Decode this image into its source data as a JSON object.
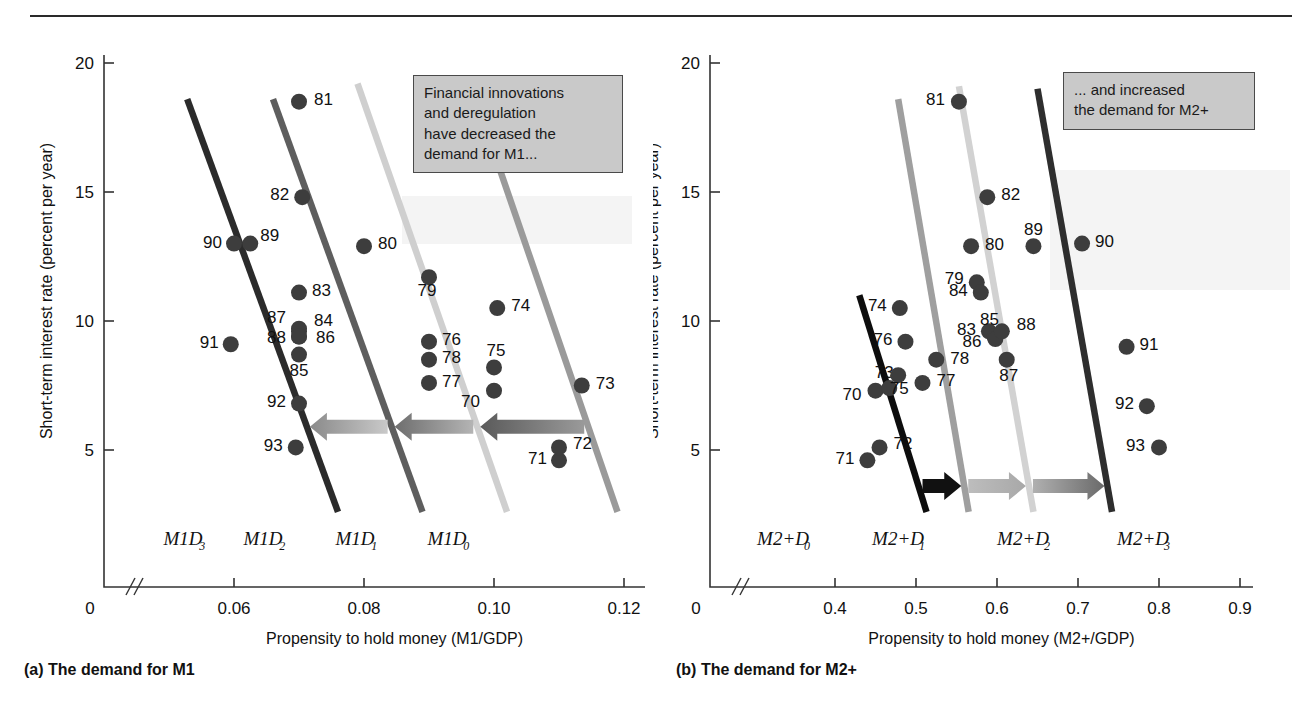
{
  "figure": {
    "panels": [
      {
        "id": "a",
        "caption": "(a) The demand for M1",
        "ylabel": "Short-term interest rate (percent per year)",
        "xlabel": "Propensity to hold money (M1/GDP)",
        "note_lines": [
          "Financial innovations",
          "and deregulation",
          "have decreased the",
          "demand for M1..."
        ],
        "x_ticks": [
          "0",
          "0.06",
          "0.08",
          "0.10",
          "0.12"
        ],
        "y_ticks": [
          "5",
          "10",
          "15",
          "20"
        ],
        "curve_labels": [
          "M1D",
          "M1D",
          "M1D",
          "M1D"
        ],
        "curve_subs": [
          "3",
          "2",
          "1",
          "0"
        ]
      },
      {
        "id": "b",
        "caption": "(b) The demand for M2+",
        "ylabel": "Short-term interest rate (percent per year)",
        "xlabel": "Propensity to hold money (M2+/GDP)",
        "note_lines": [
          "... and increased",
          "the demand for M2+"
        ],
        "x_ticks": [
          "0",
          "0.4",
          "0.5",
          "0.6",
          "0.7",
          "0.8",
          "0.9"
        ],
        "y_ticks": [
          "5",
          "10",
          "15",
          "20"
        ],
        "curve_labels": [
          "M2+D",
          "M2+D",
          "M2+D",
          "M2+D"
        ],
        "curve_subs": [
          "0",
          "1",
          "2",
          "3"
        ]
      }
    ]
  },
  "chart_data": [
    {
      "type": "scatter",
      "panel": "a",
      "title": "(a) The demand for M1",
      "xlabel": "Propensity to hold money (M1/GDP)",
      "ylabel": "Short-term interest rate (percent per year)",
      "xlim": [
        0.05,
        0.125
      ],
      "ylim": [
        0,
        20
      ],
      "xticks": [
        0.06,
        0.08,
        0.1,
        0.12
      ],
      "yticks": [
        5,
        10,
        15,
        20
      ],
      "grid": false,
      "axis_break_x": true,
      "points": [
        {
          "label": "70",
          "x": 0.1,
          "y": 7.3
        },
        {
          "label": "71",
          "x": 0.11,
          "y": 4.6
        },
        {
          "label": "72",
          "x": 0.11,
          "y": 5.1
        },
        {
          "label": "73",
          "x": 0.1135,
          "y": 7.5
        },
        {
          "label": "74",
          "x": 0.1005,
          "y": 10.5
        },
        {
          "label": "75",
          "x": 0.1,
          "y": 8.2
        },
        {
          "label": "76",
          "x": 0.09,
          "y": 9.2
        },
        {
          "label": "77",
          "x": 0.09,
          "y": 7.6
        },
        {
          "label": "78",
          "x": 0.09,
          "y": 8.5
        },
        {
          "label": "79",
          "x": 0.09,
          "y": 11.7
        },
        {
          "label": "80",
          "x": 0.08,
          "y": 12.9
        },
        {
          "label": "81",
          "x": 0.07,
          "y": 18.5
        },
        {
          "label": "82",
          "x": 0.0705,
          "y": 14.8
        },
        {
          "label": "83",
          "x": 0.07,
          "y": 11.1
        },
        {
          "label": "84",
          "x": 0.07,
          "y": 9.6
        },
        {
          "label": "85",
          "x": 0.07,
          "y": 8.7
        },
        {
          "label": "86",
          "x": 0.07,
          "y": 9.4
        },
        {
          "label": "87",
          "x": 0.07,
          "y": 9.7
        },
        {
          "label": "88",
          "x": 0.07,
          "y": 9.4
        },
        {
          "label": "89",
          "x": 0.0625,
          "y": 13.0
        },
        {
          "label": "90",
          "x": 0.06,
          "y": 13.0
        },
        {
          "label": "91",
          "x": 0.0595,
          "y": 9.1
        },
        {
          "label": "92",
          "x": 0.07,
          "y": 6.8
        },
        {
          "label": "93",
          "x": 0.0695,
          "y": 5.1
        }
      ],
      "curves": [
        {
          "name": "M1D3",
          "color": "#2b2b2b",
          "x0": 0.0528,
          "y0": 18.6,
          "x1": 0.076,
          "y1": 2.6
        },
        {
          "name": "M1D2",
          "color": "#5e5e5e",
          "x0": 0.066,
          "y0": 18.6,
          "x1": 0.089,
          "y1": 2.6
        },
        {
          "name": "M1D1",
          "color": "#cfcfcf",
          "x0": 0.079,
          "y0": 19.2,
          "x1": 0.102,
          "y1": 2.6
        },
        {
          "name": "M1D0",
          "color": "#9a9a9a",
          "x0": 0.098,
          "y0": 18.0,
          "x1": 0.119,
          "y1": 2.6
        }
      ],
      "arrows": {
        "direction": "left",
        "count": 3,
        "y": 5.9
      }
    },
    {
      "type": "scatter",
      "panel": "b",
      "title": "(b) The demand for M2+",
      "xlabel": "Propensity to hold money (M2+/GDP)",
      "ylabel": "Short-term interest rate (percent per year)",
      "xlim": [
        0.35,
        0.95
      ],
      "ylim": [
        0,
        20
      ],
      "xticks": [
        0.4,
        0.5,
        0.6,
        0.7,
        0.8,
        0.9
      ],
      "yticks": [
        5,
        10,
        15,
        20
      ],
      "grid": false,
      "axis_break_x": true,
      "points": [
        {
          "label": "70",
          "x": 0.45,
          "y": 7.3
        },
        {
          "label": "71",
          "x": 0.44,
          "y": 4.6
        },
        {
          "label": "72",
          "x": 0.455,
          "y": 5.1
        },
        {
          "label": "73",
          "x": 0.467,
          "y": 7.4
        },
        {
          "label": "74",
          "x": 0.48,
          "y": 10.5
        },
        {
          "label": "75",
          "x": 0.478,
          "y": 7.9
        },
        {
          "label": "76",
          "x": 0.487,
          "y": 9.2
        },
        {
          "label": "77",
          "x": 0.508,
          "y": 7.6
        },
        {
          "label": "78",
          "x": 0.525,
          "y": 8.5
        },
        {
          "label": "79",
          "x": 0.575,
          "y": 11.5
        },
        {
          "label": "80",
          "x": 0.568,
          "y": 12.9
        },
        {
          "label": "81",
          "x": 0.553,
          "y": 18.5
        },
        {
          "label": "82",
          "x": 0.588,
          "y": 14.8
        },
        {
          "label": "83",
          "x": 0.59,
          "y": 9.6
        },
        {
          "label": "84",
          "x": 0.58,
          "y": 11.1
        },
        {
          "label": "85",
          "x": 0.597,
          "y": 9.4
        },
        {
          "label": "86",
          "x": 0.598,
          "y": 9.3
        },
        {
          "label": "87",
          "x": 0.612,
          "y": 8.5
        },
        {
          "label": "88",
          "x": 0.606,
          "y": 9.6
        },
        {
          "label": "89",
          "x": 0.645,
          "y": 12.9
        },
        {
          "label": "90",
          "x": 0.705,
          "y": 13.0
        },
        {
          "label": "91",
          "x": 0.76,
          "y": 9.0
        },
        {
          "label": "92",
          "x": 0.785,
          "y": 6.7
        },
        {
          "label": "93",
          "x": 0.8,
          "y": 5.1
        }
      ],
      "curves": [
        {
          "name": "M2+D0",
          "color": "#0d0d0d",
          "x0": 0.43,
          "y0": 11.0,
          "x1": 0.513,
          "y1": 2.6
        },
        {
          "name": "M2+D1",
          "color": "#9f9f9f",
          "x0": 0.478,
          "y0": 18.6,
          "x1": 0.565,
          "y1": 2.6
        },
        {
          "name": "M2+D2",
          "color": "#d2d2d2",
          "x0": 0.553,
          "y0": 19.1,
          "x1": 0.645,
          "y1": 2.6
        },
        {
          "name": "M2+D3",
          "color": "#2e2e2e",
          "x0": 0.65,
          "y0": 19.0,
          "x1": 0.742,
          "y1": 2.6
        }
      ],
      "arrows": {
        "direction": "right",
        "count": 3,
        "y": 3.6
      }
    }
  ]
}
